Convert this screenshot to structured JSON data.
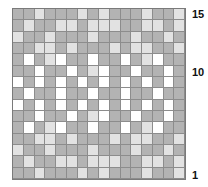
{
  "chart": {
    "columns": 16,
    "rows": 15,
    "colors": {
      "G": "#b3b3b3",
      "L": "#e2e2e2",
      "W": "#ffffff",
      "grid_line": "#8c8c8c"
    },
    "row_labels": [
      {
        "text": "15",
        "row": 15,
        "top": 9
      },
      {
        "text": "10",
        "row": 10,
        "top": 67
      },
      {
        "text": "1",
        "row": 1,
        "top": 170
      }
    ],
    "grid": [
      "GGLGGGLGLGGGLGGL",
      "GLGGLLGLLLGGLLGL",
      "LGGLGGGLGGGLGGLG",
      "GGLLGLGGGLGLLGGL",
      "GWGLWGGWGGWGLWGG",
      "GGWGGWGLWGGWGGWG",
      "WGWGWGWGWGWGWGWG",
      "GWGGWGGWGGWGGWGG",
      "WGWGWGWGWGWGWGWG",
      "GGWGGWGLWGGWGGWG",
      "GWGLWGGWGGWGLWGG",
      "GGLLGLGGGLGLLGGL",
      "LGGLGGGLGGGLGGLG",
      "GLGGLLGLLLGGLLGL",
      "GGLGGGLGLGGGLGGL"
    ]
  }
}
